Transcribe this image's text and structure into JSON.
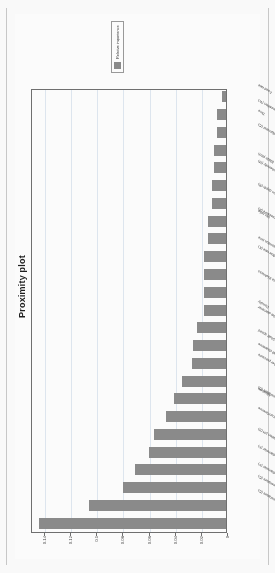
{
  "figure": {
    "title": "Proximity plot",
    "legend": {
      "label": "Relative importance",
      "swatch_color": "#8a8a8a"
    },
    "axis": {
      "value_axis_label": "",
      "ticks": [
        "0",
        "0.02",
        "0.04",
        "0.06",
        "0.08",
        "0.1",
        "0.12",
        "0.14"
      ],
      "tick_values": [
        0,
        0.02,
        0.04,
        0.06,
        0.08,
        0.1,
        0.12,
        0.14
      ]
    }
  },
  "chart_data": {
    "type": "bar",
    "title": "Proximity plot",
    "xlabel": "",
    "ylabel": "",
    "ylim": [
      0,
      0.15
    ],
    "grid": true,
    "legend_position": "right",
    "orientation": "vertical",
    "series": [
      {
        "name": "Relative importance",
        "color": "#8a8a8a"
      }
    ],
    "categories": [
      "Elbow temperature (C)",
      "Ball temperature (C)",
      "Foot diameter (F)",
      "Disc diameter (F)",
      "Oxidation pH (S)",
      "Ball circumference",
      "Inlet temperature (C)",
      "Moisture",
      "Chamber pressure",
      "Ball clearance",
      "Shaft speed",
      "Outlet diameter",
      "Density",
      "Plate thickness",
      "Cooler flow rate (K)",
      "Retention time",
      "Ambient pressure (A)",
      "Mix ratio",
      "Arm depth (R)",
      "Ball sphericity (M)",
      "Blade pitch",
      "Filter diameter (C)",
      "Feed composition (W)",
      "Time",
      "Feed rate"
    ],
    "values": [
      0.143,
      0.105,
      0.079,
      0.07,
      0.059,
      0.055,
      0.046,
      0.04,
      0.034,
      0.026,
      0.025,
      0.022,
      0.017,
      0.017,
      0.017,
      0.017,
      0.014,
      0.014,
      0.011,
      0.011,
      0.009,
      0.009,
      0.007,
      0.007,
      0.003
    ]
  }
}
